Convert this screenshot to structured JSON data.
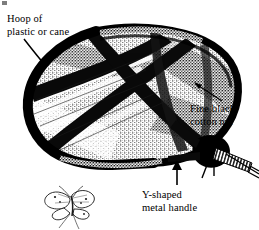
{
  "figure": {
    "background_color": "#ffffff",
    "ink_color": "#000000",
    "width": 259,
    "height": 230
  },
  "labels": {
    "hoop": {
      "line1": "Hoop of",
      "line2": "plastic or cane",
      "pointer": "arrow",
      "pointer_direction": "down-right"
    },
    "net": {
      "line1": "Fine black",
      "line2": "cotton net",
      "pointer": "leader-line",
      "pointer_direction": "up-left"
    },
    "handle": {
      "line1": "Y-shaped",
      "line2": "metal handle",
      "pointer": "arrow",
      "pointer_direction": "up"
    }
  },
  "parts": {
    "hoop_name": "hoop",
    "net_name": "net bag",
    "handle_name": "handle",
    "butterfly_name": "butterfly"
  }
}
